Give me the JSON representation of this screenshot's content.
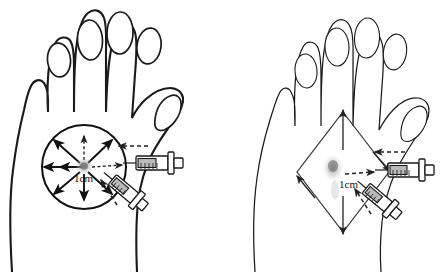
{
  "figure": {
    "background_color": "#ffffff",
    "ink_color": "#1a1a1a",
    "blob_color": "#9a9a9a",
    "plunger_color": "#b9b9b9",
    "panel_count": 2
  },
  "panels": [
    {
      "id": "left",
      "position": "left",
      "hand": {
        "name": "left-hand-dorsum",
        "view": "dorsal",
        "digits": [
          "index-finger",
          "middle-finger",
          "ring-finger",
          "little-finger",
          "thumb"
        ],
        "line_weight": "heavy"
      },
      "injection_zone": {
        "shape": "circle",
        "name": "circular-spread-zone",
        "center": {
          "x": 84,
          "y": 167
        },
        "radius": 42,
        "arrow_count": 8,
        "arrow_pattern": "radial-outward",
        "solid_arrow_directions": [
          "west",
          "northwest",
          "northeast",
          "southwest",
          "southeast",
          "east"
        ],
        "dashed_arrow_directions": [
          "north",
          "south",
          "east"
        ]
      },
      "deposit": {
        "name": "anaesthetic-deposit",
        "x": 84,
        "y": 166,
        "type": "stippled-blob"
      },
      "scale_label": {
        "text": "1cm",
        "x": 88,
        "y": 178
      },
      "syringes": [
        {
          "name": "syringe-horizontal",
          "orientation": "horizontal",
          "approach": "in-plane",
          "angle_deg": 0,
          "needle_tip": {
            "x": 123,
            "y": 163
          },
          "lead_arrow": {
            "direction": "left",
            "style": "dashed"
          }
        },
        {
          "name": "syringe-angled",
          "orientation": "diagonal",
          "approach": "oblique",
          "angle_deg": 42,
          "needle_tip": {
            "x": 110,
            "y": 176
          },
          "lead_arrow": {
            "direction": "up-left",
            "style": "dashed"
          }
        }
      ]
    },
    {
      "id": "right",
      "position": "right",
      "hand": {
        "name": "right-hand-dorsum",
        "view": "dorsal",
        "digits": [
          "index-finger",
          "middle-finger",
          "ring-finger",
          "little-finger",
          "thumb"
        ],
        "line_weight": "light"
      },
      "injection_zone": {
        "shape": "diamond",
        "name": "rhomboid-spread-zone",
        "center": {
          "x": 120,
          "y": 172
        },
        "half_width": 46,
        "half_height": 62,
        "arrow_count": 2,
        "arrow_pattern": "vertical-vertices",
        "solid_arrow_directions": [
          "north",
          "south"
        ],
        "dashed_arrow_directions": [
          "east"
        ]
      },
      "deposit": {
        "name": "anaesthetic-deposit",
        "x": 110,
        "y": 168,
        "type": "stippled-blob"
      },
      "scale_label": {
        "text": "1cm",
        "x": 128,
        "y": 183
      },
      "syringes": [
        {
          "name": "syringe-horizontal",
          "orientation": "horizontal",
          "approach": "in-plane",
          "angle_deg": 0,
          "needle_tip": {
            "x": 152,
            "y": 170
          },
          "lead_arrow": {
            "direction": "left",
            "style": "dashed"
          }
        },
        {
          "name": "syringe-angled",
          "orientation": "diagonal",
          "approach": "oblique",
          "angle_deg": 42,
          "needle_tip": {
            "x": 142,
            "y": 184
          },
          "lead_arrow": {
            "direction": "up-left",
            "style": "dashed"
          }
        }
      ]
    }
  ]
}
